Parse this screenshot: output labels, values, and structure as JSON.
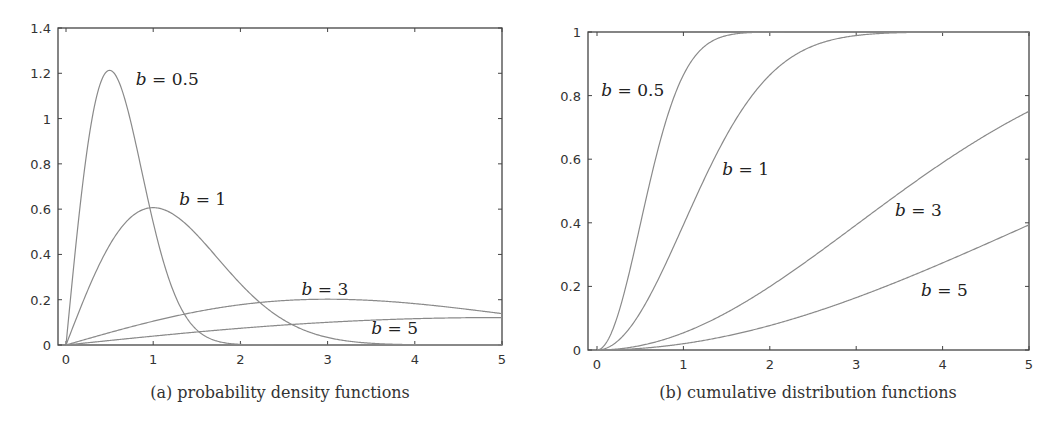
{
  "chart_data": [
    {
      "id": "pdf",
      "type": "line",
      "title": "",
      "caption": "(a) probability density functions",
      "xlabel": "",
      "ylabel": "",
      "xlim": [
        -0.1,
        5
      ],
      "ylim": [
        0,
        1.4
      ],
      "xticks": [
        0,
        1,
        2,
        3,
        4,
        5
      ],
      "xtick_labels": [
        "0",
        "1",
        "2",
        "3",
        "4",
        "5"
      ],
      "yticks": [
        0,
        0.2,
        0.4,
        0.6,
        0.8,
        1,
        1.2,
        1.4
      ],
      "ytick_labels": [
        "0",
        "0.2",
        "0.4",
        "0.6",
        "0.8",
        "1",
        "1.2",
        "1.4"
      ],
      "grid": false,
      "legend": "inline labels",
      "x": [
        0,
        0.25,
        0.5,
        0.75,
        1,
        1.5,
        2,
        2.5,
        3,
        3.5,
        4,
        4.5,
        5
      ],
      "series": [
        {
          "name": "b = 0.5",
          "b": 0.5,
          "values": [
            0,
            0.882,
            1.213,
            0.975,
            0.541,
            0.067,
            0.003,
            0,
            0,
            0,
            0,
            0,
            0
          ],
          "peak": {
            "x": 0.5,
            "y": 1.213
          }
        },
        {
          "name": "b = 1",
          "b": 1,
          "values": [
            0,
            0.242,
            0.441,
            0.566,
            0.607,
            0.487,
            0.271,
            0.11,
            0.033,
            0.008,
            0.001,
            0,
            0
          ],
          "peak": {
            "x": 1,
            "y": 0.607
          }
        },
        {
          "name": "b = 3",
          "b": 3,
          "values": [
            0,
            0.028,
            0.055,
            0.081,
            0.105,
            0.147,
            0.178,
            0.197,
            0.202,
            0.196,
            0.183,
            0.162,
            0.126
          ],
          "peak": {
            "x": 3,
            "y": 0.202
          }
        },
        {
          "name": "b = 5",
          "b": 5,
          "values": [
            0,
            0.01,
            0.02,
            0.03,
            0.039,
            0.058,
            0.074,
            0.088,
            0.1,
            0.109,
            0.116,
            0.12,
            0.121
          ],
          "peak": {
            "x": 5,
            "y": 0.121
          }
        }
      ],
      "annotations": [
        {
          "text": "b = 0.5",
          "x": 0.8,
          "y": 1.15
        },
        {
          "text": "b = 1",
          "x": 1.3,
          "y": 0.62
        },
        {
          "text": "b = 3",
          "x": 2.7,
          "y": 0.22
        },
        {
          "text": "b = 5",
          "x": 3.5,
          "y": 0.05
        }
      ]
    },
    {
      "id": "cdf",
      "type": "line",
      "title": "",
      "caption": "(b) cumulative distribution functions",
      "xlabel": "",
      "ylabel": "",
      "xlim": [
        -0.1,
        5
      ],
      "ylim": [
        0,
        1
      ],
      "xticks": [
        0,
        1,
        2,
        3,
        4,
        5
      ],
      "xtick_labels": [
        "0",
        "1",
        "2",
        "3",
        "4",
        "5"
      ],
      "yticks": [
        0,
        0.2,
        0.4,
        0.6,
        0.8,
        1
      ],
      "ytick_labels": [
        "0",
        "0.2",
        "0.4",
        "0.6",
        "0.8",
        "1"
      ],
      "grid": false,
      "legend": "inline labels",
      "x": [
        0,
        0.25,
        0.5,
        0.75,
        1,
        1.5,
        2,
        2.5,
        3,
        3.5,
        4,
        4.5,
        5
      ],
      "series": [
        {
          "name": "b = 0.5",
          "b": 0.5,
          "values": [
            0,
            0.118,
            0.393,
            0.675,
            0.865,
            0.989,
            1.0,
            1.0,
            1.0,
            1.0,
            1.0,
            1.0,
            1.0
          ]
        },
        {
          "name": "b = 1",
          "b": 1,
          "values": [
            0,
            0.031,
            0.118,
            0.245,
            0.393,
            0.675,
            0.865,
            0.956,
            0.989,
            0.998,
            1.0,
            1.0,
            1.0
          ]
        },
        {
          "name": "b = 3",
          "b": 3,
          "values": [
            0,
            0.003,
            0.014,
            0.031,
            0.054,
            0.118,
            0.199,
            0.293,
            0.393,
            0.494,
            0.589,
            0.675,
            0.751
          ]
        },
        {
          "name": "b = 5",
          "b": 5,
          "values": [
            0,
            0.001,
            0.005,
            0.011,
            0.02,
            0.044,
            0.077,
            0.118,
            0.165,
            0.217,
            0.274,
            0.333,
            0.393
          ]
        }
      ],
      "annotations": [
        {
          "text": "b = 0.5",
          "x": 0.05,
          "y": 0.8
        },
        {
          "text": "b = 1",
          "x": 1.45,
          "y": 0.55
        },
        {
          "text": "b = 3",
          "x": 3.45,
          "y": 0.42
        },
        {
          "text": "b = 5",
          "x": 3.75,
          "y": 0.17
        }
      ]
    }
  ],
  "figure": {
    "curve_color": "#8a8a8a",
    "axis_color": "#444444"
  }
}
